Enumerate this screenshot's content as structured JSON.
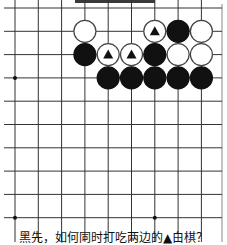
{
  "problem": {
    "caption": "黑先，如何同时打吃两边的▲白棋？",
    "to_play": "black"
  },
  "board": {
    "columns_visible": 9,
    "rows_visible": 10,
    "edges": {
      "top": "open",
      "right": "edge",
      "left": "open",
      "bottom": "open"
    },
    "star_points": [
      {
        "col": 0,
        "row": 3
      },
      {
        "col": 0,
        "row": 9
      },
      {
        "col": 6,
        "row": 9
      }
    ],
    "stones": [
      {
        "col": 3,
        "row": 1,
        "color": "white",
        "marked": false
      },
      {
        "col": 6,
        "row": 1,
        "color": "white",
        "marked": true
      },
      {
        "col": 7,
        "row": 1,
        "color": "black",
        "marked": false
      },
      {
        "col": 8,
        "row": 1,
        "color": "white",
        "marked": false
      },
      {
        "col": 3,
        "row": 2,
        "color": "black",
        "marked": false
      },
      {
        "col": 4,
        "row": 2,
        "color": "white",
        "marked": true
      },
      {
        "col": 5,
        "row": 2,
        "color": "white",
        "marked": true
      },
      {
        "col": 6,
        "row": 2,
        "color": "black",
        "marked": false
      },
      {
        "col": 7,
        "row": 2,
        "color": "white",
        "marked": false
      },
      {
        "col": 8,
        "row": 2,
        "color": "white",
        "marked": false
      },
      {
        "col": 4,
        "row": 3,
        "color": "black",
        "marked": false
      },
      {
        "col": 5,
        "row": 3,
        "color": "black",
        "marked": false
      },
      {
        "col": 6,
        "row": 3,
        "color": "black",
        "marked": false
      },
      {
        "col": 7,
        "row": 3,
        "color": "black",
        "marked": false
      },
      {
        "col": 8,
        "row": 3,
        "color": "black",
        "marked": false
      }
    ],
    "colors": {
      "line": "#333333",
      "black_stone": "#111111",
      "white_stone": "#ffffff",
      "marker": "#111111"
    }
  }
}
